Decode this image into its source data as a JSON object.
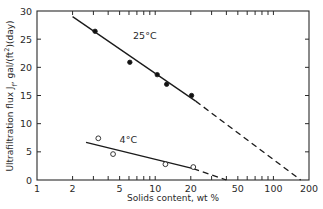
{
  "chart_data": {
    "type": "scatter",
    "title": "",
    "xlabel": "Solids content, wt %",
    "ylabel": "Ultrafiltration flux J_f, gal/(ft²)(day)",
    "ylabel_parts": {
      "pre": "Ultrafiltration flux J",
      "sub": "f",
      "post": ", gal/(ft",
      "sup": "2",
      "end": ")(day)"
    },
    "xscale": "log",
    "xlim": [
      1,
      200
    ],
    "ylim": [
      0,
      30
    ],
    "xticks": [
      1,
      2,
      5,
      10,
      20,
      50,
      100,
      200
    ],
    "xtick_labels": [
      "1",
      "2",
      "5",
      "10",
      "20",
      "50",
      "100",
      "200"
    ],
    "yticks": [
      0,
      5,
      10,
      15,
      20,
      25,
      30
    ],
    "ytick_labels": [
      "0",
      "5",
      "10",
      "15",
      "20",
      "25",
      "30"
    ],
    "grid": false,
    "series": [
      {
        "name": "25°C",
        "marker": "filled-circle",
        "points": [
          {
            "x": 3.1,
            "y": 26.4
          },
          {
            "x": 6.1,
            "y": 20.9
          },
          {
            "x": 10.4,
            "y": 18.7
          },
          {
            "x": 12.5,
            "y": 17.0
          },
          {
            "x": 20.3,
            "y": 15.0
          }
        ],
        "fit_line_solid": [
          {
            "x": 2.0,
            "y": 29.0
          },
          {
            "x": 22.0,
            "y": 14.0
          }
        ],
        "fit_line_dashed": [
          {
            "x": 22.0,
            "y": 14.0
          },
          {
            "x": 170,
            "y": 0
          }
        ]
      },
      {
        "name": "4°C",
        "marker": "open-circle",
        "points": [
          {
            "x": 3.3,
            "y": 7.4
          },
          {
            "x": 4.4,
            "y": 4.6
          },
          {
            "x": 12.2,
            "y": 2.8
          },
          {
            "x": 21.0,
            "y": 2.3
          }
        ],
        "fit_line_solid": [
          {
            "x": 2.6,
            "y": 6.7
          },
          {
            "x": 21.0,
            "y": 2.0
          }
        ],
        "fit_line_dashed": [
          {
            "x": 21.0,
            "y": 2.0
          },
          {
            "x": 40,
            "y": 0
          }
        ]
      }
    ],
    "annotations": [
      {
        "text": "25°C",
        "x": 6.5,
        "y": 25.0
      },
      {
        "text": "4°C",
        "x": 5.0,
        "y": 6.5
      }
    ]
  }
}
